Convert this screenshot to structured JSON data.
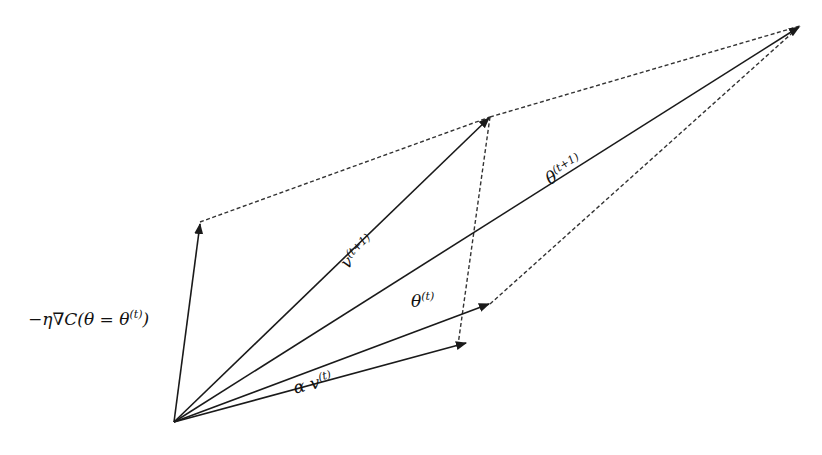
{
  "diagram": {
    "origin": {
      "x": 174,
      "y": 422
    },
    "vectors": [
      {
        "id": "gradient_step",
        "label_base": "−η∇C(θ = θ",
        "label_sup": "(t)",
        "label_tail": ")",
        "tip": {
          "x": 200,
          "y": 222
        }
      },
      {
        "id": "v_t_plus_1",
        "label_base": "v",
        "label_sup": "(t+1)",
        "tip": {
          "x": 490,
          "y": 117
        }
      },
      {
        "id": "theta_t_plus_1",
        "label_base": "θ",
        "label_sup": "(t+1)",
        "tip": {
          "x": 800,
          "y": 26
        }
      },
      {
        "id": "theta_t",
        "label_base": "θ",
        "label_sup": "(t)",
        "tip": {
          "x": 490,
          "y": 304
        }
      },
      {
        "id": "alpha_v_t",
        "label_base": "α v",
        "label_sup": "(t)",
        "tip": {
          "x": 467,
          "y": 343
        }
      }
    ],
    "dashed_edges": [
      {
        "from": "gradient_step",
        "to": "v_t_plus_1"
      },
      {
        "from": "v_t_plus_1",
        "to": "theta_t_plus_1"
      },
      {
        "from": "v_t_plus_1",
        "to": "alpha_v_t"
      },
      {
        "from": "theta_t",
        "to": "theta_t_plus_1"
      }
    ],
    "colors": {
      "line": "#1a1a1a",
      "dashed": "#333333",
      "background": "#ffffff"
    }
  }
}
